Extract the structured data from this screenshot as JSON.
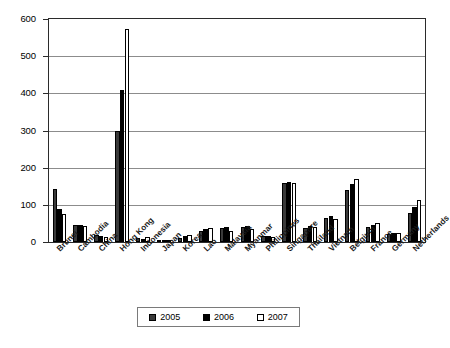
{
  "chart_data": {
    "type": "bar",
    "title": "",
    "subtitle": "",
    "xlabel": "",
    "ylabel": "",
    "ylim": [
      0,
      600
    ],
    "yticks": [
      0,
      100,
      200,
      300,
      400,
      500,
      600
    ],
    "ytick_labels": [
      "0",
      "100",
      "200",
      "300",
      "400",
      "500",
      "600"
    ],
    "grid": true,
    "legend_position": "bottom-center",
    "categories": [
      "Brunei",
      "Cambodia",
      "China",
      "Hong Kong",
      "Indonesia",
      "Japan",
      "Korea",
      "Lao",
      "Malaysia",
      "Myanmar",
      "Philippines",
      "Singapore",
      "Thailand",
      "Vietnam",
      "Belgium",
      "France",
      "Germany",
      "Netherlands"
    ],
    "series": [
      {
        "name": "2005",
        "color": "#3a3a3a",
        "values": [
          143,
          45,
          18,
          300,
          10,
          3,
          12,
          30,
          38,
          40,
          15,
          160,
          38,
          65,
          140,
          40,
          22,
          78
        ]
      },
      {
        "name": "2006",
        "color": "#000000",
        "values": [
          88,
          45,
          16,
          408,
          9,
          4,
          15,
          35,
          40,
          42,
          16,
          162,
          42,
          70,
          155,
          45,
          23,
          95
        ]
      },
      {
        "name": "2007",
        "color": "#ffffff",
        "values": [
          75,
          43,
          14,
          573,
          14,
          4,
          18,
          38,
          30,
          35,
          14,
          158,
          40,
          62,
          170,
          52,
          25,
          112
        ]
      }
    ]
  },
  "legend": {
    "items": [
      {
        "label": "2005"
      },
      {
        "label": "2006"
      },
      {
        "label": "2007"
      }
    ]
  },
  "colors": {
    "series_2005": "#3a3a3a",
    "series_2006": "#000000",
    "series_2007": "#ffffff",
    "axis": "#2b2b2b",
    "grid": "#8c8c8c",
    "background": "#ffffff"
  }
}
